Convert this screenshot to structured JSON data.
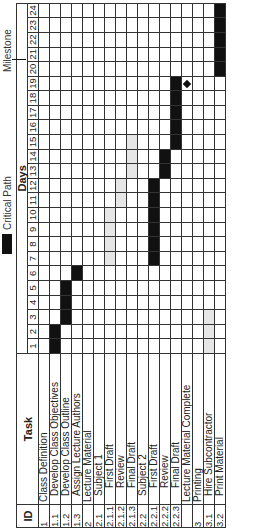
{
  "chart_data": {
    "type": "table",
    "xlabel": "Days",
    "columns": [
      "ID",
      "Task"
    ],
    "days": [
      1,
      2,
      3,
      4,
      5,
      6,
      7,
      8,
      9,
      10,
      11,
      12,
      13,
      14,
      15,
      16,
      17,
      18,
      19,
      20,
      21,
      22,
      23,
      24
    ],
    "tasks": [
      {
        "id": "1",
        "task": "Class Definition",
        "level": 0,
        "start": null,
        "end": null,
        "type": "summary"
      },
      {
        "id": "1.1",
        "task": "Develop Class Objectives",
        "level": 1,
        "start": 1,
        "end": 2,
        "type": "critical"
      },
      {
        "id": "1.2",
        "task": "Develop Class Outline",
        "level": 1,
        "start": 3,
        "end": 5,
        "type": "critical"
      },
      {
        "id": "1.3",
        "task": "Assign Lecture Authors",
        "level": 1,
        "start": 6,
        "end": 6,
        "type": "critical"
      },
      {
        "id": "2",
        "task": "Lecture Material",
        "level": 0,
        "start": null,
        "end": null,
        "type": "summary"
      },
      {
        "id": "2.1",
        "task": "Subject 1",
        "level": 1,
        "start": null,
        "end": null,
        "type": "summary"
      },
      {
        "id": "2.1.1",
        "task": "First Draft",
        "level": 2,
        "start": 7,
        "end": 10,
        "type": "normal"
      },
      {
        "id": "2.1.2",
        "task": "Review",
        "level": 2,
        "start": 11,
        "end": 12,
        "type": "normal"
      },
      {
        "id": "2.1.3",
        "task": "Final Draft",
        "level": 2,
        "start": 13,
        "end": 15,
        "type": "normal"
      },
      {
        "id": "2.2",
        "task": "Subject 2",
        "level": 1,
        "start": null,
        "end": null,
        "type": "summary"
      },
      {
        "id": "2.2.1",
        "task": "First Draft",
        "level": 2,
        "start": 7,
        "end": 12,
        "type": "critical"
      },
      {
        "id": "2.2.2",
        "task": "Review",
        "level": 2,
        "start": 13,
        "end": 14,
        "type": "critical"
      },
      {
        "id": "2.2.3",
        "task": "Final Draft",
        "level": 2,
        "start": 15,
        "end": 19,
        "type": "critical"
      },
      {
        "id": "",
        "task": "Lecture Material Complete",
        "level": 0,
        "start": 19,
        "end": 19,
        "type": "milestone"
      },
      {
        "id": "3",
        "task": "Printing",
        "level": 0,
        "start": null,
        "end": null,
        "type": "summary"
      },
      {
        "id": "3.1",
        "task": "Hire Subcontractor",
        "level": 1,
        "start": 1,
        "end": 3,
        "type": "normal"
      },
      {
        "id": "3.2",
        "task": "Print Material",
        "level": 1,
        "start": 20,
        "end": 24,
        "type": "critical"
      }
    ],
    "legend": [
      {
        "label": "Critical Path",
        "color": "#111111"
      }
    ],
    "annotations": [
      {
        "label": "Milestone",
        "target": "Lecture Material Complete",
        "day": 19
      }
    ],
    "colors": {
      "critical": "#111111",
      "normal": "#e6e6e6"
    }
  },
  "header": {
    "id": "ID",
    "task": "Task",
    "days": "Days"
  },
  "legend": {
    "critical_path": "Critical Path",
    "milestone": "Milestone"
  }
}
